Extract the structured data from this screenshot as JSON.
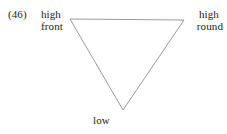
{
  "figure": {
    "example_number": "(46)",
    "stroke_color": "#8c8c8c",
    "text_color": "#1a1a1a",
    "background_color": "#ffffff",
    "vertices": {
      "top_left": {
        "label_line1": "high",
        "label_line2": "front",
        "x": 70,
        "y": 19
      },
      "top_right": {
        "label_line1": "high",
        "label_line2": "round",
        "x": 184,
        "y": 20
      },
      "bottom": {
        "label_line1": "low",
        "x": 123,
        "y": 110
      }
    },
    "shape": "inverted-triangle",
    "edges": [
      {
        "from": "top_left",
        "to": "top_right"
      },
      {
        "from": "top_right",
        "to": "bottom"
      },
      {
        "from": "bottom",
        "to": "top_left"
      }
    ]
  }
}
